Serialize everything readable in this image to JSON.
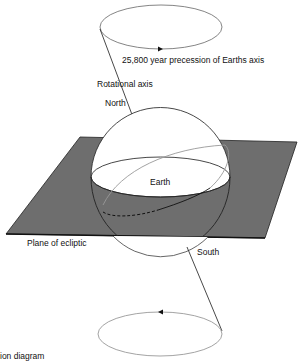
{
  "diagram": {
    "type": "precession-of-earth-axis",
    "labels": {
      "precession": "25,800 year precession of Earths axis",
      "rotational_axis": "Rotational axis",
      "north": "North",
      "earth": "Earth",
      "plane": "Plane of ecliptic",
      "south": "South",
      "caption_fragment": "ion diagram"
    },
    "colors": {
      "plane_fill": "#6e6e6e",
      "line": "#333333",
      "light_line": "#999999",
      "sphere_fill": "#ffffff"
    }
  }
}
